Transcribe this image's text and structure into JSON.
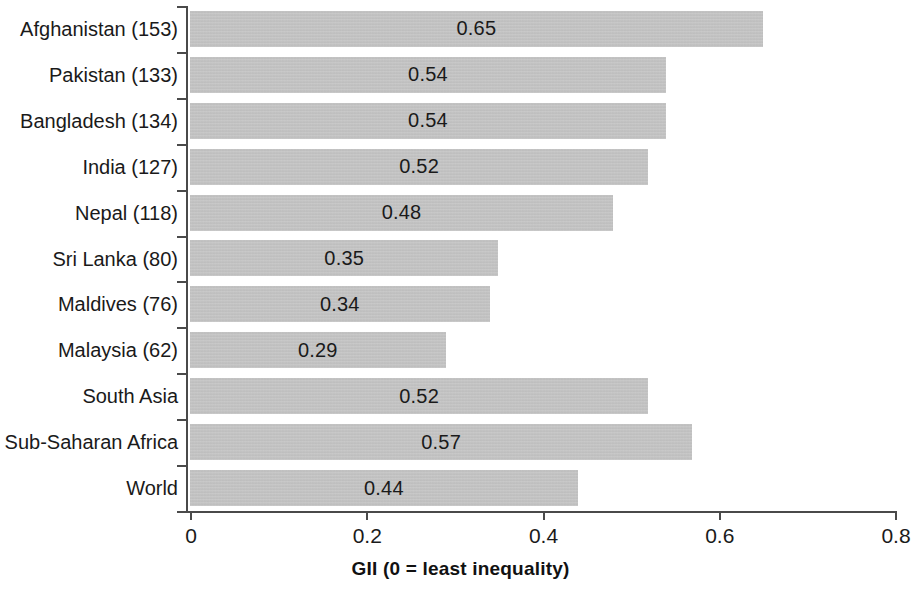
{
  "chart_data": {
    "type": "bar",
    "orientation": "horizontal",
    "title": "",
    "xlabel": "GII (0 = least inequality)",
    "ylabel": "",
    "xlim": [
      0,
      0.8
    ],
    "xticks": [
      "0",
      "0.2",
      "0.4",
      "0.6",
      "0.8"
    ],
    "xtick_values": [
      0,
      0.2,
      0.4,
      0.6,
      0.8
    ],
    "grid": false,
    "legend": null,
    "bar_color": "#c2c2c2",
    "categories": [
      "Afghanistan (153)",
      "Pakistan (133)",
      "Bangladesh (134)",
      "India (127)",
      "Nepal (118)",
      "Sri Lanka (80)",
      "Maldives (76)",
      "Malaysia (62)",
      "South Asia",
      "Sub-Saharan Africa",
      "World"
    ],
    "values": [
      0.65,
      0.54,
      0.54,
      0.52,
      0.48,
      0.35,
      0.34,
      0.29,
      0.52,
      0.57,
      0.44
    ],
    "value_labels": [
      "0.65",
      "0.54",
      "0.54",
      "0.52",
      "0.48",
      "0.35",
      "0.34",
      "0.29",
      "0.52",
      "0.57",
      "0.44"
    ]
  }
}
